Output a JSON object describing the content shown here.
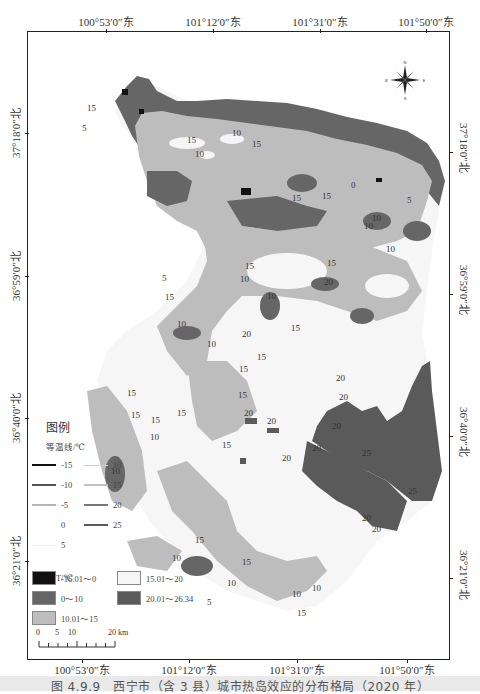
{
  "map": {
    "title": "西宁市（含3县）城市热岛效应分布格局",
    "top_coords": [
      {
        "label": "100°53′0″东",
        "x": 106
      },
      {
        "label": "101°12′0″东",
        "x": 213
      },
      {
        "label": "101°31′0″东",
        "x": 320
      },
      {
        "label": "101°50′0″东",
        "x": 426
      }
    ],
    "bottom_coords": [
      {
        "label": "100°53′0″东",
        "x": 106
      },
      {
        "label": "101°12′0″东",
        "x": 213
      },
      {
        "label": "101°31′0″东",
        "x": 320
      },
      {
        "label": "101°50′0″东",
        "x": 426
      }
    ],
    "left_coords": [
      {
        "label": "37°18′0″北",
        "y": 133
      },
      {
        "label": "36°59′0″北",
        "y": 276
      },
      {
        "label": "36°40′0″北",
        "y": 418
      },
      {
        "label": "36°21′0″北",
        "y": 561
      }
    ],
    "right_coords": [
      {
        "label": "37°18′0″北",
        "y": 133
      },
      {
        "label": "36°59′0″北",
        "y": 276
      },
      {
        "label": "36°40′0″北",
        "y": 418
      },
      {
        "label": "36°21′0″北",
        "y": 561
      }
    ],
    "compass": {
      "icon": "compass-rose-icon",
      "n": "N",
      "s": "S",
      "e": "E",
      "w": "W"
    },
    "contour_labels": [
      "5",
      "10",
      "15",
      "20",
      "25",
      "0"
    ]
  },
  "legend": {
    "title": "图例",
    "isotherm_title": "等温线/℃",
    "isotherms": [
      {
        "value": "-15",
        "color": "#111111",
        "width": 2.5
      },
      {
        "value": "-10",
        "color": "#555555",
        "width": 2.5
      },
      {
        "value": "-5",
        "color": "#b5b5b5",
        "width": 2
      },
      {
        "value": "0",
        "color": "#ffffff",
        "width": 2
      },
      {
        "value": "5",
        "color": "#ededed",
        "width": 1.5
      },
      {
        "value": "10",
        "color": "#d0d0d0",
        "width": 1.5
      },
      {
        "value": "15",
        "color": "#c0c0c0",
        "width": 2
      },
      {
        "value": "20",
        "color": "#777777",
        "width": 2.5
      },
      {
        "value": "25",
        "color": "#5a5a5a",
        "width": 2.5
      }
    ],
    "lst_title": "LST/℃",
    "lst_classes": [
      {
        "range": "-16.01～0",
        "color": "#111111"
      },
      {
        "range": "0～10",
        "color": "#666666"
      },
      {
        "range": "10.01～15",
        "color": "#bdbdbd"
      },
      {
        "range": "15.01～20",
        "color": "#f6f6f6"
      },
      {
        "range": "20.01～26.34",
        "color": "#5a5a5a"
      }
    ]
  },
  "scalebar": {
    "labels": [
      "0",
      "5",
      "10",
      "20 km"
    ]
  },
  "caption": "图 4.9.9　西宁市（含 3 县）城市热岛效应的分布格局（2020 年）"
}
